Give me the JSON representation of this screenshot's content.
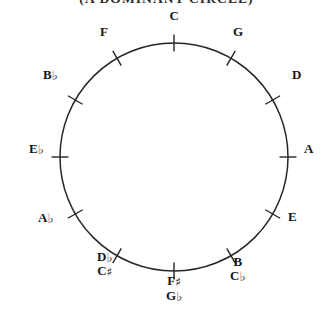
{
  "title": "(A DOMINANT CIRCLE)",
  "diagram": {
    "name": "circle-of-fifths",
    "shape": "circle",
    "center_x": 174,
    "center_y": 157,
    "radius": 114,
    "stroke_color": "#262626",
    "background_color": "#ffffff",
    "tick_count": 12,
    "tick_length": 17,
    "positions": [
      {
        "id": "c",
        "angle_deg": 0,
        "primary": "C",
        "alternate": "",
        "label_x": 174,
        "label_y": 16,
        "align": "center"
      },
      {
        "id": "g",
        "angle_deg": 30,
        "primary": "G",
        "alternate": "",
        "label_x": 238,
        "label_y": 32,
        "align": "center"
      },
      {
        "id": "d",
        "angle_deg": 60,
        "primary": "D",
        "alternate": "",
        "label_x": 292,
        "label_y": 75,
        "align": "left"
      },
      {
        "id": "a",
        "angle_deg": 90,
        "primary": "A",
        "alternate": "",
        "label_x": 304,
        "label_y": 149,
        "align": "left"
      },
      {
        "id": "e",
        "angle_deg": 120,
        "primary": "E",
        "alternate": "",
        "label_x": 288,
        "label_y": 217,
        "align": "left"
      },
      {
        "id": "b-cb",
        "angle_deg": 150,
        "primary": "B",
        "alternate": "C♭",
        "label_x": 238,
        "label_y": 269,
        "align": "center"
      },
      {
        "id": "fs-gb",
        "angle_deg": 180,
        "primary": "F♯",
        "alternate": "G♭",
        "label_x": 174,
        "label_y": 288,
        "align": "center"
      },
      {
        "id": "db-cs",
        "angle_deg": 210,
        "primary": "D♭",
        "alternate": "C♯",
        "label_x": 105,
        "label_y": 264,
        "align": "center"
      },
      {
        "id": "ab",
        "angle_deg": 240,
        "primary": "A♭",
        "alternate": "",
        "label_x": 54,
        "label_y": 218,
        "align": "right"
      },
      {
        "id": "eb",
        "angle_deg": 270,
        "primary": "E♭",
        "alternate": "",
        "label_x": 44,
        "label_y": 149,
        "align": "right"
      },
      {
        "id": "bb",
        "angle_deg": 300,
        "primary": "B♭",
        "alternate": "",
        "label_x": 58,
        "label_y": 75,
        "align": "right"
      },
      {
        "id": "f",
        "angle_deg": 330,
        "primary": "F",
        "alternate": "",
        "label_x": 104,
        "label_y": 32,
        "align": "center"
      }
    ]
  }
}
